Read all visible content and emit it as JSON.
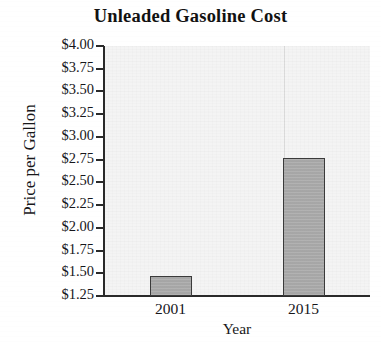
{
  "chart_data": {
    "type": "bar",
    "title": "Unleaded Gasoline Cost",
    "xlabel": "Year",
    "ylabel": "Price per Gallon",
    "categories": [
      "2001",
      "2015"
    ],
    "values": [
      1.47,
      2.77
    ],
    "ylim": [
      1.25,
      4.0
    ],
    "ytick_step": 0.25,
    "ytick_labels": [
      "$4.00",
      "$3.75",
      "$3.50",
      "$3.25",
      "$3.00",
      "$2.75",
      "$2.50",
      "$2.25",
      "$2.00",
      "$1.75",
      "$1.50",
      "$1.25"
    ],
    "ytick_values": [
      4.0,
      3.75,
      3.5,
      3.25,
      3.0,
      2.75,
      2.5,
      2.25,
      2.0,
      1.75,
      1.5,
      1.25
    ],
    "grid": false,
    "legend": null,
    "bar_fill_color": "#a9a9a9",
    "bar_edge_color": "#3a3a3a",
    "plot_background_color": "#f4f4f4",
    "axis_color": "#2a2a2a",
    "text_color": "#16161a"
  }
}
